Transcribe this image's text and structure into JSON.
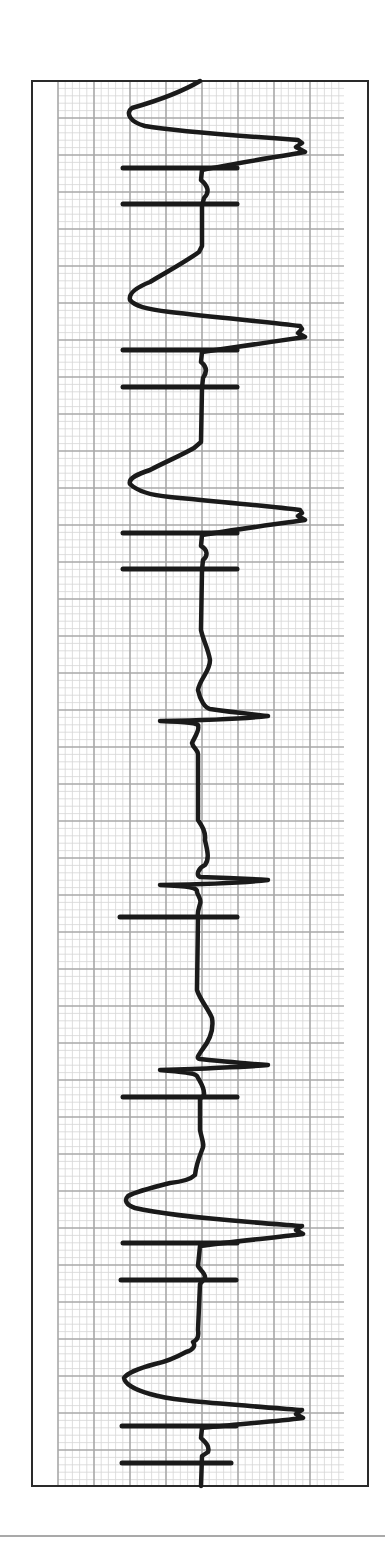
{
  "colors": {
    "background": "#ffffff",
    "frame": "#2a2a2a",
    "grid_major": "#a8a8a8",
    "grid_minor": "#d6d6d6",
    "trace": "#1a1a1a",
    "rule": "#555555"
  },
  "layout": {
    "frame": {
      "x": 32,
      "y": 81,
      "w": 336,
      "h": 1405
    },
    "grid": {
      "x": 58,
      "y": 81,
      "w": 286,
      "h": 1405
    },
    "major_spacing_x": 36,
    "major_spacing_y": 37,
    "minor_per_major": 5,
    "bottom_rule_y": 1536
  },
  "chart_data": {
    "type": "line",
    "title": "",
    "xlabel": "",
    "ylabel": "",
    "orientation": "vertical-strip (time runs top to bottom)",
    "grid": true,
    "legend": null,
    "baseline_x": 202,
    "beats": [
      {
        "type": "wide",
        "y_start": 81,
        "left_peak": [
          130,
          112
        ],
        "right_peak": [
          305,
          152
        ]
      },
      {
        "type": "wide",
        "y_start": 265,
        "left_peak": [
          128,
          298
        ],
        "right_peak": [
          305,
          337
        ]
      },
      {
        "type": "wide",
        "y_start": 440,
        "left_peak": [
          128,
          480
        ],
        "right_peak": [
          305,
          516
        ]
      },
      {
        "type": "narrow",
        "y": 718,
        "left_spike": 158,
        "right_spike": 268
      },
      {
        "type": "narrow",
        "y": 880,
        "left_spike": 158,
        "right_spike": 268
      },
      {
        "type": "narrow",
        "y": 1066,
        "left_spike": 158,
        "right_spike": 268
      },
      {
        "type": "wide",
        "y_start": 1190,
        "left_peak": [
          126,
          1200
        ],
        "right_peak": [
          305,
          1230
        ]
      },
      {
        "type": "wide",
        "y_start": 1345,
        "left_peak": [
          124,
          1378
        ],
        "right_peak": [
          305,
          1415
        ]
      }
    ],
    "marker_bars": [
      {
        "y": 168,
        "x1": 123,
        "x2": 237
      },
      {
        "y": 204,
        "x1": 123,
        "x2": 237
      },
      {
        "y": 350,
        "x1": 123,
        "x2": 237
      },
      {
        "y": 387,
        "x1": 123,
        "x2": 237
      },
      {
        "y": 533,
        "x1": 123,
        "x2": 237
      },
      {
        "y": 569,
        "x1": 123,
        "x2": 237
      },
      {
        "y": 917,
        "x1": 120,
        "x2": 237
      },
      {
        "y": 1097,
        "x1": 123,
        "x2": 237
      },
      {
        "y": 1243,
        "x1": 123,
        "x2": 237
      },
      {
        "y": 1280,
        "x1": 121,
        "x2": 236
      },
      {
        "y": 1426,
        "x1": 122,
        "x2": 236
      },
      {
        "y": 1463,
        "x1": 122,
        "x2": 231
      }
    ],
    "trace_path": "M 200 81 C 185 90 160 100 132 108 C 125 113 130 122 145 126 C 180 132 240 136 298 140 L 302 143 L 296 147 L 305 152 C 270 158 230 164 202 170 L 201 180 C 208 186 210 192 204 198 L 202 206 L 202 246 L 199 252 C 185 262 170 270 150 282 C 140 286 128 292 130 300 C 135 306 145 309 170 312 C 220 318 270 322 300 326 L 302 329 L 298 333 L 305 337 C 270 342 230 348 202 352 L 201 362 C 206 366 208 371 203 378 L 202 388 L 201 442 L 194 448 C 180 456 165 462 150 470 C 138 474 128 478 130 484 C 136 490 148 495 170 497 C 220 502 270 506 300 510 L 302 513 L 298 516 L 305 520 C 270 525 232 530 202 535 L 201 546 C 208 550 208 556 203 560 L 202 570 L 201 630 C 203 640 208 648 210 660 C 210 672 200 678 198 690 C 200 700 205 708 210 709 C 230 712 250 714 268 716 C 250 718 220 720 160 721 C 185 722 200 723 198 726 C 200 730 194 738 192 743 C 193 748 198 750 198 754 L 198 820 C 202 826 206 832 205 840 C 207 850 210 858 205 865 C 198 868 196 875 200 877 C 230 878 250 879 268 880 C 250 882 220 884 160 885 C 190 886 198 888 197 892 C 198 896 202 900 200 904 C 199 908 197 912 198 917 L 197 990 C 200 1000 208 1008 212 1018 C 214 1030 210 1040 202 1050 C 198 1056 196 1058 200 1059 C 230 1062 250 1064 268 1065 C 250 1067 220 1068 160 1070 C 185 1072 195 1073 197 1076 C 200 1082 205 1088 204 1095 L 200 1099 L 200 1130 C 202 1140 205 1145 202 1150 C 198 1160 196 1166 195 1175 C 190 1180 180 1182 170 1183 C 150 1188 135 1192 128 1196 C 124 1200 126 1205 135 1208 C 160 1214 200 1218 250 1222 C 270 1224 290 1225 302 1226 L 296 1230 L 303 1234 C 270 1238 230 1242 200 1246 L 198 1266 C 200 1270 206 1274 205 1278 L 200 1284 L 198 1330 C 199 1336 198 1340 193 1342 C 196 1346 193 1350 186 1352 C 175 1358 165 1362 155 1364 C 140 1368 128 1372 124 1378 C 125 1384 135 1390 150 1394 C 170 1400 200 1402 250 1406 C 270 1408 290 1409 302 1410 L 296 1414 L 303 1418 C 270 1422 230 1425 202 1428 L 201 1438 C 205 1442 210 1446 208 1452 L 202 1456 L 201 1486"
  }
}
